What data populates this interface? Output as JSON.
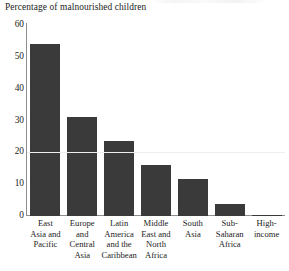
{
  "chart_data": {
    "type": "bar",
    "title": "Percentage of malnourished children",
    "xlabel": "",
    "ylabel": "",
    "ylim": [
      0,
      60
    ],
    "yticks": [
      0,
      10,
      20,
      30,
      40,
      50,
      60
    ],
    "grid": false,
    "legend": null,
    "bar_color": "#3a3a3a",
    "axis_color": "#8d8d8d",
    "categories": [
      "East Asia and Pacific",
      "Europe and Central Asia",
      "Latin America and the Caribbean",
      "Middle East and North Africa",
      "South Asia",
      "Sub-Saharan Africa",
      "High-income"
    ],
    "category_lines": [
      [
        "East",
        "Asia and",
        "Pacific"
      ],
      [
        "Europe",
        "and",
        "Central",
        "Asia"
      ],
      [
        "Latin",
        "America",
        "and the",
        "Caribbean"
      ],
      [
        "Middle",
        "East and",
        "North",
        "Africa"
      ],
      [
        "South",
        "Asia"
      ],
      [
        "Sub-",
        "Saharan",
        "Africa"
      ],
      [
        "High-",
        "income"
      ]
    ],
    "values": [
      54,
      31,
      23.5,
      16,
      11.5,
      3.5,
      0.3
    ]
  },
  "yaxis": {
    "labels": [
      "60",
      "50",
      "40",
      "30",
      "20",
      "10",
      "0"
    ]
  }
}
